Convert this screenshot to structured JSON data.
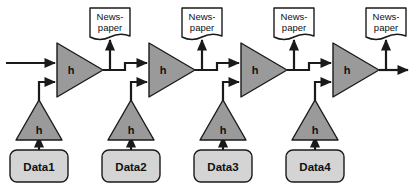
{
  "diagram": {
    "canvas": {
      "width": 413,
      "height": 190,
      "background": "#ffffff"
    },
    "colors": {
      "amplifier_fill": "#9a9a9a",
      "data_box_fill": "#d4d4d4",
      "document_fill": "#ffffff",
      "stroke": "#1a1a1a",
      "text": "#111111"
    },
    "stages": [
      {
        "id": "stage-1",
        "main_amplifier_label": "h",
        "feeder_amplifier_label": "h",
        "data_label": "Data1",
        "document_label_line1": "News-",
        "document_label_line2": "paper"
      },
      {
        "id": "stage-2",
        "main_amplifier_label": "h",
        "feeder_amplifier_label": "h",
        "data_label": "Data2",
        "document_label_line1": "News-",
        "document_label_line2": "paper"
      },
      {
        "id": "stage-3",
        "main_amplifier_label": "h",
        "feeder_amplifier_label": "h",
        "data_label": "Data3",
        "document_label_line1": "News-",
        "document_label_line2": "paper"
      },
      {
        "id": "stage-4",
        "main_amplifier_label": "h",
        "feeder_amplifier_label": "h",
        "data_label": "Data4",
        "document_label_line1": "News-",
        "document_label_line2": "paper"
      }
    ]
  }
}
